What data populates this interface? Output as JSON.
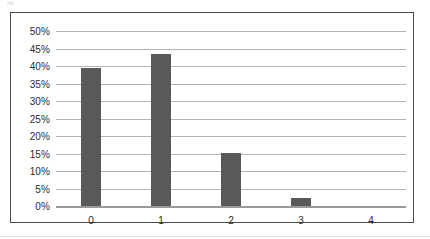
{
  "chart_data": {
    "type": "bar",
    "title": "",
    "subtitle": "",
    "xlabel": "",
    "ylabel": "",
    "categories": [
      "0",
      "1",
      "2",
      "3",
      "4"
    ],
    "values": [
      39.5,
      43.5,
      15.2,
      2.2,
      0
    ],
    "value_unit": "%",
    "ylim": [
      0,
      50
    ],
    "ytick_step": 5,
    "ytick_labels": [
      "0%",
      "5%",
      "10%",
      "15%",
      "20%",
      "25%",
      "30%",
      "35%",
      "40%",
      "45%",
      "50%"
    ],
    "ytick_values": [
      0,
      5,
      10,
      15,
      20,
      25,
      30,
      35,
      40,
      45,
      50
    ],
    "grid": true,
    "grid_axis": "y",
    "legend": false,
    "legend_position": "none",
    "series": [
      {
        "name": "",
        "values": [
          39.5,
          43.5,
          15.2,
          2.2,
          0
        ]
      }
    ],
    "colors": {
      "bar": "#59595A",
      "gridline": "#B4B4B4",
      "baseline": "#9A9A9A",
      "frame_border": "#4A4A4A",
      "plot_background": "#FFFFFF",
      "tick_label": "#2B2B2B"
    }
  }
}
